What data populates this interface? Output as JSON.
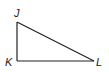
{
  "diagram": {
    "type": "right-triangle",
    "stroke_color": "#222222",
    "background": "#ffffff",
    "vertices": [
      {
        "id": "J",
        "label": "J",
        "x": 17,
        "y": 22,
        "label_x": 14,
        "label_y": 17
      },
      {
        "id": "K",
        "label": "K",
        "x": 17,
        "y": 61,
        "label_x": 5,
        "label_y": 66
      },
      {
        "id": "L",
        "label": "L",
        "x": 94,
        "y": 61,
        "label_x": 96,
        "label_y": 66
      }
    ],
    "segments": [
      {
        "from": "J",
        "to": "K"
      },
      {
        "from": "K",
        "to": "L"
      },
      {
        "from": "L",
        "to": "J"
      }
    ]
  }
}
